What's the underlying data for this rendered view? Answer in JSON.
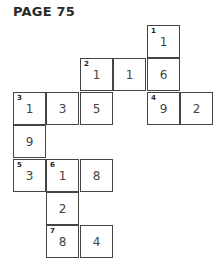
{
  "header": {
    "title": "PAGE 75"
  },
  "puzzle": {
    "cells": [
      {
        "col": 4,
        "row": 0,
        "value": "1",
        "clue": "1"
      },
      {
        "col": 2,
        "row": 1,
        "value": "1",
        "clue": "2"
      },
      {
        "col": 3,
        "row": 1,
        "value": "1",
        "clue": ""
      },
      {
        "col": 4,
        "row": 1,
        "value": "6",
        "clue": ""
      },
      {
        "col": 0,
        "row": 2,
        "value": "1",
        "clue": "3"
      },
      {
        "col": 1,
        "row": 2,
        "value": "3",
        "clue": ""
      },
      {
        "col": 2,
        "row": 2,
        "value": "5",
        "clue": ""
      },
      {
        "col": 4,
        "row": 2,
        "value": "9",
        "clue": "4"
      },
      {
        "col": 5,
        "row": 2,
        "value": "2",
        "clue": ""
      },
      {
        "col": 0,
        "row": 3,
        "value": "9",
        "clue": ""
      },
      {
        "col": 0,
        "row": 4,
        "value": "3",
        "clue": "5"
      },
      {
        "col": 1,
        "row": 4,
        "value": "1",
        "clue": "6"
      },
      {
        "col": 2,
        "row": 4,
        "value": "8",
        "clue": ""
      },
      {
        "col": 1,
        "row": 5,
        "value": "2",
        "clue": ""
      },
      {
        "col": 1,
        "row": 6,
        "value": "8",
        "clue": "7"
      },
      {
        "col": 2,
        "row": 6,
        "value": "4",
        "clue": ""
      }
    ]
  }
}
